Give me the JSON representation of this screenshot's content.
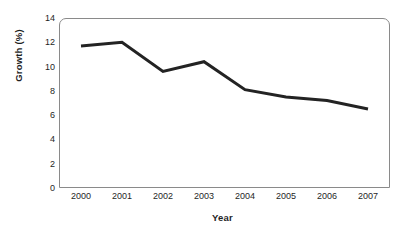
{
  "chart_data": {
    "type": "line",
    "title": "",
    "xlabel": "Year",
    "ylabel": "Growth (%)",
    "categories": [
      "2000",
      "2001",
      "2002",
      "2003",
      "2004",
      "2005",
      "2006",
      "2007"
    ],
    "x": [
      2000,
      2001,
      2002,
      2003,
      2004,
      2005,
      2006,
      2007
    ],
    "values": [
      11.7,
      12.0,
      9.6,
      10.4,
      8.1,
      7.5,
      7.2,
      6.5
    ],
    "series": [
      {
        "name": "Growth",
        "values": [
          11.7,
          12.0,
          9.6,
          10.4,
          8.1,
          7.5,
          7.2,
          6.5
        ]
      }
    ],
    "ylim": [
      0,
      14
    ],
    "yticks": [
      0,
      2,
      4,
      6,
      8,
      10,
      12,
      14
    ],
    "ytick_labels": [
      "0",
      "2",
      "4",
      "6",
      "8",
      "10",
      "12",
      "14"
    ],
    "xlim": [
      2000,
      2007
    ],
    "grid": false,
    "legend": false,
    "legend_position": "none",
    "line_color": "#232323",
    "line_width": 3,
    "markers": false,
    "frame_color": "#8a8a8a",
    "background_color": "#ffffff"
  },
  "axes": {
    "y_title": "Growth (%)",
    "x_title": "Year"
  }
}
